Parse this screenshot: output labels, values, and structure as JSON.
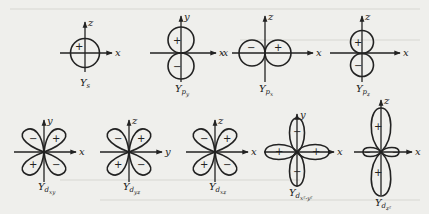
{
  "figure": {
    "ink_color": "#222222",
    "background_color": "#efefec",
    "rows": [
      {
        "orbitals": [
          {
            "id": "s",
            "caption_main": "Y",
            "caption_sub": "s",
            "axis_h": "x",
            "axis_v": "z",
            "signs": [
              "+"
            ]
          },
          {
            "id": "py",
            "caption_main": "Y",
            "caption_sub": "p",
            "caption_subsub": "y",
            "axis_h": "x",
            "axis_v": "y",
            "signs": [
              "+",
              "−"
            ]
          },
          {
            "id": "px",
            "caption_main": "Y",
            "caption_sub": "p",
            "caption_subsub": "x",
            "axis_h": "x",
            "axis_h_neg": "-x",
            "axis_v": "z",
            "signs": [
              "−",
              "+"
            ]
          },
          {
            "id": "pz",
            "caption_main": "Y",
            "caption_sub": "p",
            "caption_subsub": "z",
            "axis_h": "x",
            "axis_v": "z",
            "signs": [
              "+",
              "−"
            ]
          }
        ]
      },
      {
        "orbitals": [
          {
            "id": "dxy",
            "caption_main": "Y",
            "caption_sub": "d",
            "caption_subsub": "xy",
            "axis_h": "x",
            "axis_v": "y",
            "signs": [
              "−",
              "+",
              "+",
              "−"
            ]
          },
          {
            "id": "dyz",
            "caption_main": "Y",
            "caption_sub": "d",
            "caption_subsub": "yz",
            "axis_h": "y",
            "axis_v": "z",
            "signs": [
              "−",
              "+",
              "+",
              "−"
            ]
          },
          {
            "id": "dxz",
            "caption_main": "Y",
            "caption_sub": "d",
            "caption_subsub": "xz",
            "axis_h": "x",
            "axis_v": "z",
            "signs": [
              "−",
              "+",
              "+",
              "−"
            ]
          },
          {
            "id": "dx2y2",
            "caption_main": "Y",
            "caption_sub": "d",
            "caption_subsub": "x²-y²",
            "axis_h": "x",
            "axis_v": "y",
            "signs": [
              "−",
              "+",
              "+",
              "−"
            ]
          },
          {
            "id": "dz2",
            "caption_main": "Y",
            "caption_sub": "d",
            "caption_subsub": "z²",
            "axis_h": "x",
            "axis_v": "z",
            "signs": [
              "+",
              "−",
              "+"
            ]
          }
        ]
      }
    ]
  }
}
